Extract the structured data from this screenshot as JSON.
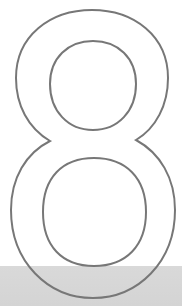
{
  "graphic": {
    "numeral": "8",
    "style": "outline",
    "stroke_color": "#777777",
    "stroke_width": 2,
    "background_color": "#ffffff"
  },
  "band": {
    "color": "#d6d6d6",
    "top": 266
  }
}
